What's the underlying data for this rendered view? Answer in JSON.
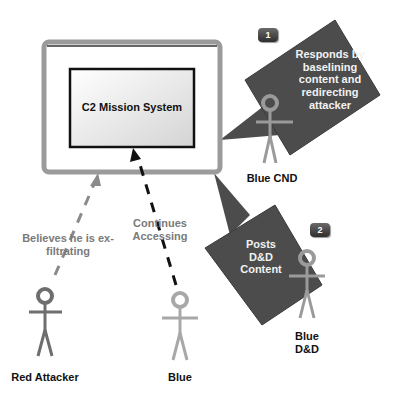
{
  "system": {
    "title": "C2 Mission System"
  },
  "callouts": [
    {
      "badge": "1",
      "text": "Responds by baselining content and redirecting attacker"
    },
    {
      "badge": "2",
      "text": "Posts D&D Content"
    }
  ],
  "actors": [
    {
      "name": "Red Attacker",
      "action": "Believes he is ex-filtrating",
      "color": "#6e6e6e"
    },
    {
      "name": "Blue",
      "action": "Continues Accessing",
      "color": "#a8a8a8"
    },
    {
      "name": "Blue CND",
      "color": "#9a9a9a"
    },
    {
      "name": "Blue D&D",
      "color": "#9a9a9a"
    }
  ],
  "colors": {
    "frame": "#9b9b9b",
    "callout": "#4a4a4a",
    "arrow_blue": "#111111",
    "arrow_red": "#8a8a8a"
  }
}
